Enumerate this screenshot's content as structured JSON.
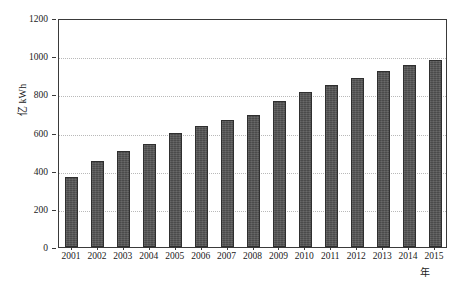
{
  "chart_data": {
    "type": "bar",
    "title": "",
    "subtitle": "",
    "xlabel": "年",
    "ylabel": "亿 kWh",
    "categories": [
      "2001",
      "2002",
      "2003",
      "2004",
      "2005",
      "2006",
      "2007",
      "2008",
      "2009",
      "2010",
      "2011",
      "2012",
      "2013",
      "2014",
      "2015"
    ],
    "values": [
      367,
      450,
      503,
      540,
      600,
      634,
      665,
      694,
      765,
      812,
      848,
      886,
      920,
      953,
      978
    ],
    "series": [
      {
        "name": "年用电量",
        "values": [
          367,
          450,
          503,
          540,
          600,
          634,
          665,
          694,
          765,
          812,
          848,
          886,
          920,
          953,
          978
        ]
      }
    ],
    "ylim": [
      0,
      1200
    ],
    "ytick_labels": [
      "0",
      "200",
      "400",
      "600",
      "800",
      "1000",
      "1200"
    ],
    "ytick_values": [
      0,
      200,
      400,
      600,
      800,
      1000,
      1200
    ],
    "xtick_labels": [
      "2001",
      "2002",
      "2003",
      "2004",
      "2005",
      "2006",
      "2007",
      "2008",
      "2009",
      "2010",
      "2011",
      "2012",
      "2013",
      "2014",
      "2015"
    ],
    "grid": "horizontal-dotted",
    "legend": "none",
    "bar_color": "#4b4b4b",
    "bar_edge_color": "#2f2f2f",
    "gridline_color": "#b9b9b9",
    "axis_color": "#3a3a3a",
    "background_color": "#ffffff"
  }
}
